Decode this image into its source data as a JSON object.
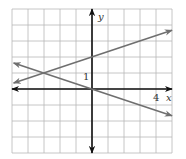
{
  "chart_data": {
    "type": "line",
    "title": "",
    "xlabel": "x",
    "ylabel": "y",
    "xlim": [
      -5,
      5
    ],
    "ylim": [
      -4,
      5
    ],
    "grid": true,
    "grid_step": 1,
    "tick_labels": {
      "x": [
        {
          "value": 4,
          "label": "4"
        }
      ],
      "y": [
        {
          "value": 1,
          "label": "1"
        }
      ]
    },
    "series": [
      {
        "name": "line-increasing",
        "equation": "y = (1/3)x + 2",
        "slope": 0.3333,
        "intercept": 2,
        "x": [
          -4.9,
          5
        ],
        "y": [
          0.37,
          3.67
        ],
        "arrows_both_ends": true
      },
      {
        "name": "line-decreasing",
        "equation": "y = -(1/3)x",
        "slope": -0.3333,
        "intercept": 0,
        "x": [
          -4.9,
          5
        ],
        "y": [
          1.63,
          -1.67
        ],
        "arrows_both_ends": true
      }
    ],
    "annotations": [
      {
        "type": "intersection",
        "x": -3,
        "y": 1
      }
    ]
  },
  "labels": {
    "x_axis": "x",
    "y_axis": "y",
    "x_tick": "4",
    "y_tick": "1"
  },
  "colors": {
    "grid": "#b8b8b8",
    "axes": "#111111",
    "lines": "#6f6f6f"
  }
}
